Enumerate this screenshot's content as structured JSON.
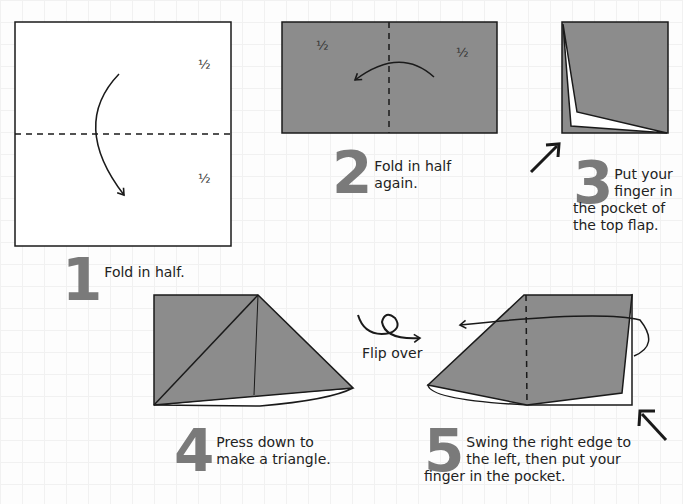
{
  "colors": {
    "paper_grey": "#8c8c8c",
    "stroke": "#1a1a1a",
    "number": "#7a7a7a",
    "background": "#fdfdfd"
  },
  "labels": {
    "half": "½",
    "flip_over": "Flip over"
  },
  "steps": [
    {
      "number": "1",
      "text": "Fold in half."
    },
    {
      "number": "2",
      "text_line1": "Fold in half",
      "text_line2": "again."
    },
    {
      "number": "3",
      "text_line1": "Put your",
      "text_line2": "finger in",
      "text_line3": "the pocket of",
      "text_line4": "the top flap."
    },
    {
      "number": "4",
      "text_line1": "Press down to",
      "text_line2": "make a triangle."
    },
    {
      "number": "5",
      "text_line1": "Swing the right edge to",
      "text_line2": "the left, then put your",
      "text_line3": "finger in the pocket."
    }
  ]
}
